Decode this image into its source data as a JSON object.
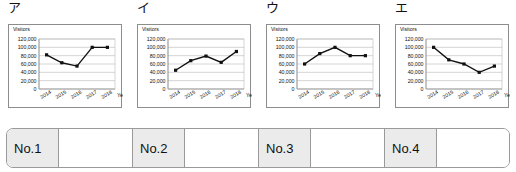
{
  "charts": [
    {
      "option_label": "ア",
      "chart_data": {
        "type": "line",
        "title": "",
        "ylabel": "Visitors",
        "xlabel": "Year",
        "categories": [
          "2014",
          "2015",
          "2016",
          "2017",
          "2018"
        ],
        "values": [
          82000,
          63000,
          55000,
          100000,
          100000
        ],
        "yticks": [
          "0",
          "20,000",
          "40,000",
          "60,000",
          "80,000",
          "100,000",
          "120,000"
        ],
        "ylim": [
          0,
          120000
        ],
        "grid": true,
        "legend": "none",
        "marker": "square",
        "line_color": "#111111"
      }
    },
    {
      "option_label": "イ",
      "chart_data": {
        "type": "line",
        "title": "",
        "ylabel": "Visitors",
        "xlabel": "Year",
        "categories": [
          "2014",
          "2015",
          "2016",
          "2017",
          "2018"
        ],
        "values": [
          45000,
          68000,
          79000,
          64000,
          90000
        ],
        "yticks": [
          "0",
          "20,000",
          "40,000",
          "60,000",
          "80,000",
          "100,000",
          "120,000"
        ],
        "ylim": [
          0,
          120000
        ],
        "grid": true,
        "legend": "none",
        "marker": "square",
        "line_color": "#111111"
      }
    },
    {
      "option_label": "ウ",
      "chart_data": {
        "type": "line",
        "title": "",
        "ylabel": "Visitors",
        "xlabel": "Year",
        "categories": [
          "2014",
          "2015",
          "2016",
          "2017",
          "2018"
        ],
        "values": [
          60000,
          85000,
          100000,
          80000,
          80000
        ],
        "yticks": [
          "0",
          "20,000",
          "40,000",
          "60,000",
          "80,000",
          "100,000",
          "120,000"
        ],
        "ylim": [
          0,
          120000
        ],
        "grid": true,
        "legend": "none",
        "marker": "square",
        "line_color": "#111111"
      }
    },
    {
      "option_label": "エ",
      "chart_data": {
        "type": "line",
        "title": "",
        "ylabel": "Visitors",
        "xlabel": "Year",
        "categories": [
          "2014",
          "2015",
          "2016",
          "2017",
          "2018"
        ],
        "values": [
          100000,
          70000,
          60000,
          40000,
          55000
        ],
        "yticks": [
          "0",
          "20,000",
          "40,000",
          "60,000",
          "80,000",
          "100,000",
          "120,000"
        ],
        "ylim": [
          0,
          120000
        ],
        "grid": true,
        "legend": "none",
        "marker": "square",
        "line_color": "#111111"
      }
    }
  ],
  "answer_bar": {
    "cells": [
      {
        "label": "No.1",
        "value": ""
      },
      {
        "label": "No.2",
        "value": ""
      },
      {
        "label": "No.3",
        "value": ""
      },
      {
        "label": "No.4",
        "value": ""
      }
    ]
  }
}
